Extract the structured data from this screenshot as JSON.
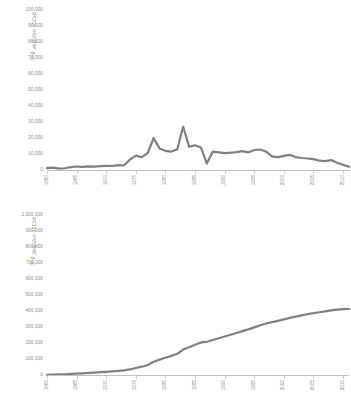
{
  "chart_data": [
    {
      "id": "annual",
      "type": "line",
      "title": "",
      "xlabel": "",
      "ylabel": "잣나무 조림면적 (ha)",
      "ylim": [
        0,
        100000
      ],
      "xlim": [
        1960,
        2011
      ],
      "grid": false,
      "legend": null,
      "line_color": "#808080",
      "ytick_labels": [
        "100,000",
        "90,000",
        "80,000",
        "70,000",
        "60,000",
        "50,000",
        "40,000",
        "30,000",
        "20,000",
        "10,000",
        "0"
      ],
      "ytick_values": [
        100000,
        90000,
        80000,
        70000,
        60000,
        50000,
        40000,
        30000,
        20000,
        10000,
        0
      ],
      "xtick_labels": [
        "1960",
        "1965",
        "1970",
        "1975",
        "1980",
        "1985",
        "1990",
        "1995",
        "2000",
        "2005",
        "2010"
      ],
      "xtick_values": [
        1960,
        1965,
        1970,
        1975,
        1980,
        1985,
        1990,
        1995,
        2000,
        2005,
        2010
      ],
      "x": [
        1960,
        1961,
        1962,
        1963,
        1964,
        1965,
        1966,
        1967,
        1968,
        1969,
        1970,
        1971,
        1972,
        1973,
        1974,
        1975,
        1976,
        1977,
        1978,
        1979,
        1980,
        1981,
        1982,
        1983,
        1984,
        1985,
        1986,
        1987,
        1988,
        1989,
        1990,
        1991,
        1992,
        1993,
        1994,
        1995,
        1996,
        1997,
        1998,
        1999,
        2000,
        2001,
        2002,
        2003,
        2004,
        2005,
        2006,
        2007,
        2008,
        2009,
        2010,
        2011
      ],
      "values": [
        1200,
        1500,
        900,
        1100,
        1800,
        2200,
        2000,
        2300,
        2100,
        2400,
        2600,
        2500,
        3000,
        2800,
        6500,
        9000,
        8000,
        10500,
        20000,
        13500,
        12000,
        11500,
        13000,
        27000,
        14500,
        15500,
        14000,
        4000,
        11500,
        11000,
        10500,
        10800,
        11200,
        11800,
        11000,
        12500,
        12800,
        11500,
        8500,
        8000,
        8800,
        9500,
        8000,
        7500,
        7200,
        6800,
        5800,
        5500,
        6200,
        4500,
        3200,
        2000
      ]
    },
    {
      "id": "cumulative",
      "type": "line",
      "title": "",
      "xlabel": "",
      "ylabel": "잣나무 조림면적 (ha)",
      "ylim": [
        0,
        1000000
      ],
      "xlim": [
        1960,
        2011
      ],
      "grid": false,
      "legend": null,
      "line_color": "#808080",
      "ytick_labels": [
        "1,000,000",
        "900,000",
        "800,000",
        "700,000",
        "600,000",
        "500,000",
        "400,000",
        "300,000",
        "200,000",
        "100,000",
        "0"
      ],
      "ytick_values": [
        1000000,
        900000,
        800000,
        700000,
        600000,
        500000,
        400000,
        300000,
        200000,
        100000,
        0
      ],
      "xtick_labels": [
        "1960",
        "1965",
        "1970",
        "1975",
        "1980",
        "1985",
        "1990",
        "1995",
        "2000",
        "2005",
        "2010"
      ],
      "xtick_values": [
        1960,
        1965,
        1970,
        1975,
        1980,
        1985,
        1990,
        1995,
        2000,
        2005,
        2010
      ],
      "x": [
        1960,
        1961,
        1962,
        1963,
        1964,
        1965,
        1966,
        1967,
        1968,
        1969,
        1970,
        1971,
        1972,
        1973,
        1974,
        1975,
        1976,
        1977,
        1978,
        1979,
        1980,
        1981,
        1982,
        1983,
        1984,
        1985,
        1986,
        1987,
        1988,
        1989,
        1990,
        1991,
        1992,
        1993,
        1994,
        1995,
        1996,
        1997,
        1998,
        1999,
        2000,
        2001,
        2002,
        2003,
        2004,
        2005,
        2006,
        2007,
        2008,
        2009,
        2010,
        2011
      ],
      "values": [
        1200,
        2700,
        3600,
        4700,
        6500,
        8700,
        10700,
        13000,
        15100,
        17500,
        20100,
        22600,
        25600,
        28400,
        34900,
        43900,
        51900,
        62400,
        82400,
        95900,
        107900,
        119400,
        132400,
        159400,
        173900,
        189400,
        203400,
        207400,
        218900,
        229900,
        240400,
        251200,
        262400,
        274200,
        285200,
        297700,
        310500,
        322000,
        330500,
        338500,
        347300,
        356800,
        364800,
        372300,
        379500,
        386300,
        392100,
        397600,
        403800,
        408300,
        411500,
        413500
      ]
    }
  ]
}
